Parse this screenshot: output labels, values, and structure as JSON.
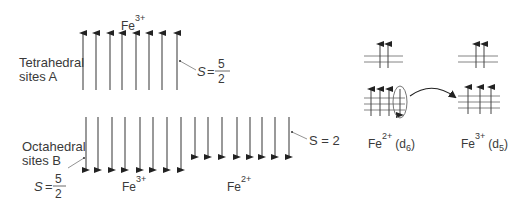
{
  "diagram": {
    "colors": {
      "line": "#555555",
      "text": "#3a3a3a",
      "arrowhead": "#222222"
    },
    "sublattice_a": {
      "label_line1": "Tetrahedral",
      "label_line2": "sites A",
      "ion": "Fe",
      "ion_charge": "3+",
      "spin_label": "S =",
      "spin_num": "5",
      "spin_den": "2",
      "arrow_count": 8,
      "arrow_direction": "up"
    },
    "sublattice_b": {
      "label_line1": "Octahedral",
      "label_line2": "sites B",
      "fe3": {
        "ion": "Fe",
        "ion_charge": "3+",
        "spin_label": "S =",
        "spin_num": "5",
        "spin_den": "2",
        "arrow_count": 8,
        "arrow_direction": "down"
      },
      "fe2": {
        "ion": "Fe",
        "ion_charge": "2+",
        "spin_label": "S = 2",
        "arrow_count": 8,
        "arrow_direction": "down"
      }
    },
    "electron_transfer": {
      "left": {
        "ion": "Fe",
        "charge": "2+",
        "config_pre": "(d",
        "config_sub": "6",
        "config_post": ")"
      },
      "right": {
        "ion": "Fe",
        "charge": "3+",
        "config_pre": "(d",
        "config_sub": "5",
        "config_post": ")"
      }
    }
  }
}
